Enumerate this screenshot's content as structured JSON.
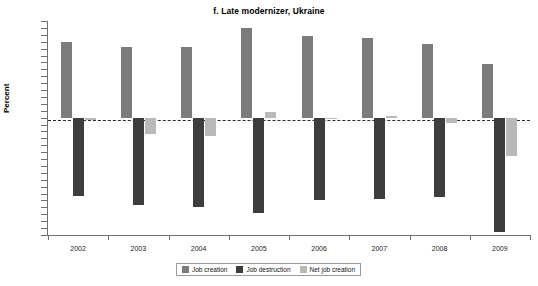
{
  "chart_data": {
    "type": "bar",
    "title": "f. Late modernizer, Ukraine",
    "xlabel": "",
    "ylabel": "Percent",
    "categories": [
      "2002",
      "2003",
      "2004",
      "2005",
      "2006",
      "2007",
      "2008",
      "2009"
    ],
    "ylim": [
      -17,
      14
    ],
    "ytick_labels": [
      "14",
      "13",
      "12",
      "11",
      "10",
      "9",
      "8",
      "7",
      "6",
      "5",
      "4",
      "3",
      "2",
      "1",
      "0",
      "-1",
      "-2",
      "-3",
      "-4",
      "-5",
      "-6",
      "-7",
      "-8",
      "-9",
      "-10",
      "-11",
      "-12",
      "-13",
      "-14",
      "-15",
      "-16",
      "-17"
    ],
    "grid": false,
    "legend_position": "bottom",
    "zero_line": 0,
    "series": [
      {
        "name": "Job creation",
        "color": "#7b7b7b",
        "values": [
          11.0,
          10.3,
          10.3,
          13.0,
          11.8,
          11.5,
          10.7,
          7.8
        ]
      },
      {
        "name": "Job destruction",
        "color": "#3d3d3d",
        "values": [
          -11.3,
          -12.6,
          -12.9,
          -13.8,
          -12.0,
          -11.8,
          -11.5,
          -16.5
        ]
      },
      {
        "name": "Net job creation",
        "color": "#b9b9b9",
        "values": [
          -0.3,
          -2.3,
          -2.6,
          0.8,
          -0.2,
          0.3,
          -0.8,
          -5.5
        ]
      }
    ]
  },
  "legend": {
    "items": [
      {
        "label": "Job creation",
        "color": "#7b7b7b"
      },
      {
        "label": "Job destruction",
        "color": "#3d3d3d"
      },
      {
        "label": "Net job creation",
        "color": "#b9b9b9"
      }
    ]
  }
}
